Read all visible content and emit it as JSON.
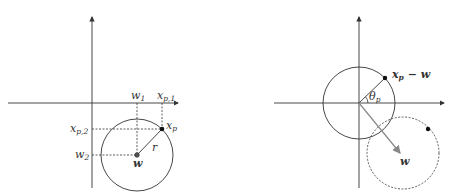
{
  "left_panel": {
    "labels": {
      "w1_main": "w",
      "w1_sub": "1",
      "xp1_main": "x",
      "xp1_sub": "p,1",
      "xp2_main": "x",
      "xp2_sub": "p,2",
      "w2_main": "w",
      "w2_sub": "2",
      "xp_main": "x",
      "xp_sub": "p",
      "r": "r",
      "w": "w"
    }
  },
  "right_panel": {
    "labels": {
      "xpw_main": "x",
      "xpw_sub": "p",
      "xpw_rest": " − w",
      "theta_main": "θ",
      "theta_sub": "p",
      "w": "w"
    }
  },
  "colors": {
    "stroke": "#333333",
    "arrow": "#888888"
  }
}
